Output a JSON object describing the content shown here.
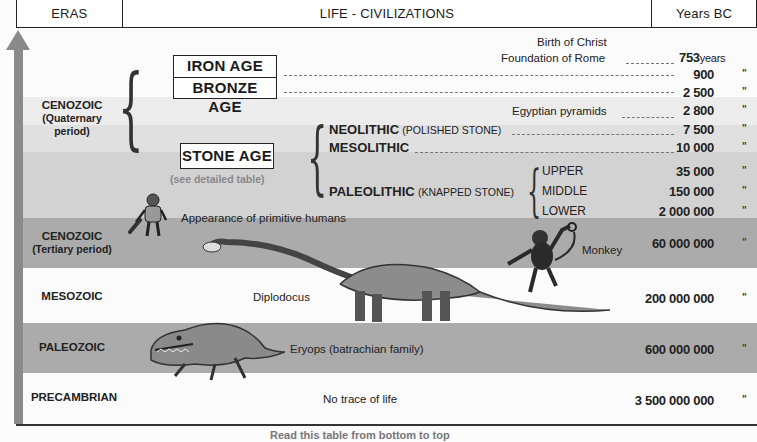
{
  "header": {
    "col_eras": "ERAS",
    "col_life": "LIFE - CIVILIZATIONS",
    "col_years": "Years BC"
  },
  "colors": {
    "white": "#fbfbfb",
    "very_light_gray": "#ececec",
    "light_gray": "#dedede",
    "mid_light_gray": "#d0d0d0",
    "mid_gray": "#a9a9a9",
    "arrow": "#8a8a8a"
  },
  "eras": [
    {
      "name": "CENOZOIC",
      "sub1": "(Quaternary",
      "sub2": "period)"
    },
    {
      "name": "CENOZOIC",
      "sub1": "(Tertiary period)"
    },
    {
      "name": "MESOZOIC"
    },
    {
      "name": "PALEOZOIC"
    },
    {
      "name": "PRECAMBRIAN"
    }
  ],
  "ages": {
    "iron": "IRON AGE",
    "bronze": "BRONZE AGE",
    "stone": "STONE AGE",
    "stone_note": "(see detailed table)"
  },
  "events": {
    "birth_of_christ": "Birth of Christ",
    "foundation_of_rome": "Foundation of Rome",
    "egyptian_pyramids": "Egyptian pyramids",
    "neolithic": "NEOLITHIC",
    "neolithic_note": "(POLISHED STONE)",
    "mesolithic": "MESOLITHIC",
    "paleolithic": "PALEOLITHIC",
    "paleolithic_note": "(KNAPPED STONE)",
    "upper": "UPPER",
    "middle": "MIDDLE",
    "lower": "LOWER",
    "primitive_humans": "Appearance of primitive humans",
    "monkey": "Monkey",
    "diplodocus": "Diplodocus",
    "eryops": "Eryops (batrachian family)",
    "no_life": "No trace of life"
  },
  "years": {
    "rome": "753",
    "rome_unit": "years",
    "iron": "900",
    "bronze": "2 500",
    "pyramids": "2 800",
    "neolithic": "7 500",
    "mesolithic": "10 000",
    "upper": "35 000",
    "middle": "150 000",
    "lower": "2 000 000",
    "tertiary": "60 000 000",
    "mesozoic": "200 000 000",
    "paleozoic": "600 000 000",
    "precambrian": "3 500 000 000",
    "ditto": "\""
  },
  "footer": {
    "caption": "Read this table from bottom to top"
  }
}
